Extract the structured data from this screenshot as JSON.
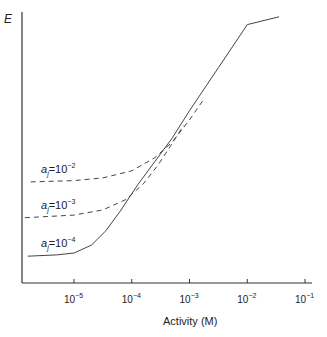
{
  "chart_data": {
    "type": "line",
    "title": "",
    "xlabel": "Activity (M)",
    "ylabel": "E",
    "xscale": "log",
    "xlim_log10": [
      -5.9,
      -0.9
    ],
    "ylim": [
      0,
      210
    ],
    "x_ticks": [
      {
        "exp": -5,
        "base": "10",
        "sup": "−5"
      },
      {
        "exp": -4,
        "base": "10",
        "sup": "−4"
      },
      {
        "exp": -3,
        "base": "10",
        "sup": "−3"
      },
      {
        "exp": -2,
        "base": "10",
        "sup": "−2"
      },
      {
        "exp": -1,
        "base": "10",
        "sup": "−1"
      }
    ],
    "series": [
      {
        "name": "a_j=10^-2",
        "label_main": "a",
        "label_sub": "j",
        "label_eq": "=10",
        "label_sup": "−2",
        "style": "dashed",
        "points": [
          [
            -5.75,
            77.5
          ],
          [
            -5.0,
            78.5
          ],
          [
            -4.5,
            80.5
          ],
          [
            -4.0,
            86
          ],
          [
            -3.6,
            96
          ],
          [
            -3.3,
            108
          ],
          [
            -3.0,
            125
          ],
          [
            -2.75,
            141
          ]
        ]
      },
      {
        "name": "a_j=10^-3",
        "label_main": "a",
        "label_sub": "j",
        "label_eq": "=10",
        "label_sup": "−3",
        "style": "dashed",
        "points": [
          [
            -5.85,
            50
          ],
          [
            -5.0,
            52
          ],
          [
            -4.5,
            56
          ],
          [
            -4.1,
            64
          ],
          [
            -3.8,
            76
          ],
          [
            -3.55,
            90
          ],
          [
            -3.3,
            107
          ],
          [
            -3.1,
            121
          ]
        ]
      },
      {
        "name": "a_j=10^-4",
        "label_main": "a",
        "label_sub": "j",
        "label_eq": "=10",
        "label_sup": "−4",
        "style": "solid",
        "points": [
          [
            -5.8,
            20.5
          ],
          [
            -5.3,
            21.5
          ],
          [
            -5.0,
            23
          ],
          [
            -4.7,
            29
          ],
          [
            -4.45,
            40
          ],
          [
            -4.2,
            55
          ],
          [
            -3.9,
            75
          ],
          [
            -3.6,
            93
          ],
          [
            -3.3,
            111
          ],
          [
            -3.0,
            132
          ],
          [
            -2.5,
            165
          ],
          [
            -2.0,
            198
          ],
          [
            -1.45,
            204
          ]
        ]
      }
    ],
    "grid": false,
    "legend": "inline-left"
  }
}
